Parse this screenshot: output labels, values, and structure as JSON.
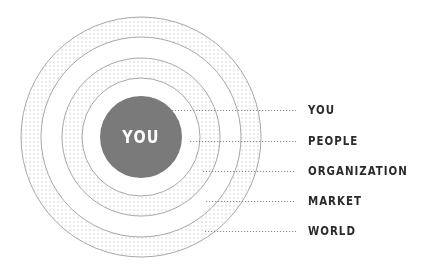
{
  "diagram": {
    "type": "concentric-circles",
    "center_label": "YOU",
    "colors": {
      "center_fill": "#7a7a7a",
      "ring_stroke": "#a8a8a8",
      "dot_color": "#c9c9c9",
      "leader_line": "#8a8a8a",
      "label_text": "#2b2b2b",
      "center_text": "#ffffff"
    },
    "levels": [
      {
        "label": "YOU"
      },
      {
        "label": "PEOPLE"
      },
      {
        "label": "ORGANIZATION"
      },
      {
        "label": "MARKET"
      },
      {
        "label": "WORLD"
      }
    ]
  }
}
